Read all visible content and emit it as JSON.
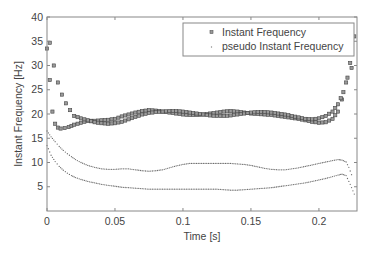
{
  "chart_data": {
    "type": "scatter",
    "title": "",
    "xlabel": "Time [s]",
    "ylabel": "Instant Frequency [Hz]",
    "xlim": [
      0,
      0.228
    ],
    "ylim": [
      0,
      40
    ],
    "xticks": [
      0,
      0.05,
      0.1,
      0.15,
      0.2
    ],
    "xtick_labels": [
      "0",
      "0.05",
      "0.1",
      "0.15",
      "0.2"
    ],
    "yticks": [
      5,
      10,
      15,
      20,
      25,
      30,
      35,
      40
    ],
    "ytick_labels": [
      "5",
      "10",
      "15",
      "20",
      "25",
      "30",
      "35",
      "40"
    ],
    "grid": false,
    "legend_position": "upper right",
    "series": [
      {
        "name": "Instant Frequency",
        "marker": "square",
        "color": "#555555",
        "branches": [
          {
            "x": [
              0.0,
              0.002,
              0.004,
              0.006,
              0.008,
              0.01,
              0.013,
              0.016,
              0.02,
              0.025,
              0.03,
              0.035,
              0.04,
              0.045,
              0.05,
              0.055,
              0.06,
              0.065,
              0.07,
              0.075,
              0.08,
              0.085,
              0.09,
              0.095,
              0.1,
              0.105,
              0.11,
              0.115,
              0.12,
              0.125,
              0.13,
              0.135,
              0.14,
              0.145,
              0.15,
              0.155,
              0.16,
              0.165,
              0.17,
              0.175,
              0.18,
              0.185,
              0.19,
              0.195,
              0.2,
              0.205,
              0.21,
              0.214,
              0.217,
              0.22,
              0.223,
              0.226
            ],
            "y": [
              33.5,
              27.0,
              20.5,
              18.0,
              17.2,
              17.0,
              17.1,
              17.3,
              17.8,
              18.2,
              18.6,
              18.6,
              18.7,
              18.8,
              19.0,
              19.5,
              19.9,
              20.3,
              20.6,
              20.8,
              20.7,
              20.5,
              20.3,
              20.1,
              19.9,
              19.8,
              19.8,
              19.9,
              20.1,
              20.3,
              20.5,
              20.6,
              20.5,
              20.3,
              20.1,
              20.0,
              19.9,
              19.8,
              19.6,
              19.4,
              19.2,
              19.0,
              18.7,
              18.4,
              18.2,
              18.3,
              19.0,
              20.5,
              23.0,
              26.5,
              30.5,
              36.0
            ]
          },
          {
            "x": [
              0.002,
              0.005,
              0.008,
              0.011,
              0.014,
              0.017,
              0.02,
              0.025,
              0.03,
              0.035,
              0.04,
              0.045,
              0.05,
              0.055,
              0.06,
              0.065,
              0.07,
              0.075,
              0.08,
              0.085,
              0.09,
              0.095,
              0.1,
              0.105,
              0.11,
              0.115,
              0.12,
              0.125,
              0.13,
              0.135,
              0.14,
              0.145,
              0.15,
              0.155,
              0.16,
              0.165,
              0.17,
              0.175,
              0.18,
              0.185,
              0.19,
              0.195,
              0.2,
              0.205,
              0.21,
              0.214,
              0.218,
              0.221,
              0.224
            ],
            "y": [
              34.7,
              30.0,
              26.5,
              24.0,
              22.2,
              20.8,
              19.6,
              19.1,
              18.7,
              18.3,
              18.1,
              18.0,
              18.1,
              18.4,
              18.9,
              19.4,
              19.9,
              20.2,
              20.4,
              20.5,
              20.6,
              20.6,
              20.5,
              20.3,
              20.1,
              19.9,
              19.7,
              19.6,
              19.6,
              19.7,
              19.9,
              20.1,
              20.3,
              20.4,
              20.4,
              20.3,
              20.1,
              19.9,
              19.6,
              19.3,
              19.0,
              18.9,
              19.1,
              19.6,
              20.5,
              22.0,
              24.5,
              27.5,
              29.5
            ]
          }
        ]
      },
      {
        "name": "pseudo Instant Frequency",
        "marker": "dot",
        "color": "#777777",
        "branches": [
          {
            "x": [
              0.0,
              0.003,
              0.006,
              0.009,
              0.012,
              0.015,
              0.018,
              0.021,
              0.025,
              0.03,
              0.035,
              0.04,
              0.045,
              0.05,
              0.055,
              0.06,
              0.065,
              0.07,
              0.075,
              0.08,
              0.085,
              0.09,
              0.095,
              0.1,
              0.105,
              0.11,
              0.115,
              0.12,
              0.125,
              0.13,
              0.135,
              0.14,
              0.145,
              0.15,
              0.155,
              0.16,
              0.165,
              0.17,
              0.175,
              0.18,
              0.185,
              0.19,
              0.195,
              0.2,
              0.205,
              0.21,
              0.214,
              0.217,
              0.22,
              0.222,
              0.224
            ],
            "y": [
              16.5,
              15.3,
              14.3,
              13.3,
              12.5,
              11.8,
              11.2,
              10.6,
              10.0,
              9.4,
              9.0,
              8.7,
              8.6,
              8.6,
              8.7,
              8.7,
              8.5,
              8.3,
              8.2,
              8.3,
              8.5,
              8.9,
              9.3,
              9.6,
              9.8,
              9.8,
              9.8,
              9.8,
              9.8,
              9.8,
              9.8,
              9.7,
              9.6,
              9.4,
              9.1,
              8.8,
              8.6,
              8.5,
              8.5,
              8.7,
              8.9,
              9.2,
              9.5,
              9.8,
              10.1,
              10.4,
              10.6,
              10.5,
              10.1,
              9.0,
              7.5
            ]
          },
          {
            "x": [
              0.0,
              0.003,
              0.006,
              0.009,
              0.012,
              0.015,
              0.018,
              0.021,
              0.025,
              0.03,
              0.035,
              0.04,
              0.045,
              0.05,
              0.055,
              0.06,
              0.065,
              0.07,
              0.075,
              0.08,
              0.085,
              0.09,
              0.095,
              0.1,
              0.105,
              0.11,
              0.115,
              0.12,
              0.125,
              0.13,
              0.135,
              0.14,
              0.145,
              0.15,
              0.155,
              0.16,
              0.165,
              0.17,
              0.175,
              0.18,
              0.185,
              0.19,
              0.195,
              0.2,
              0.205,
              0.21,
              0.214,
              0.217,
              0.22,
              0.223,
              0.226
            ],
            "y": [
              13.5,
              11.5,
              10.2,
              9.2,
              8.4,
              7.8,
              7.3,
              6.9,
              6.5,
              6.1,
              5.8,
              5.5,
              5.3,
              5.1,
              4.9,
              4.8,
              4.7,
              4.6,
              4.5,
              4.5,
              4.5,
              4.5,
              4.5,
              4.5,
              4.5,
              4.5,
              4.5,
              4.5,
              4.5,
              4.4,
              4.3,
              4.3,
              4.4,
              4.5,
              4.6,
              4.7,
              4.8,
              5.0,
              5.2,
              5.4,
              5.6,
              5.8,
              6.1,
              6.4,
              6.7,
              7.1,
              7.4,
              7.6,
              7.3,
              5.5,
              3.5
            ]
          }
        ]
      }
    ]
  },
  "legend": {
    "items": [
      {
        "label": "Instant Frequency",
        "marker": "square"
      },
      {
        "label": "pseudo Instant Frequency",
        "marker": "dot"
      }
    ]
  },
  "axes": {
    "xlabel": "Time [s]",
    "ylabel": "Instant Frequency [Hz]"
  },
  "colors": {
    "frame": "#888888",
    "text": "#444444",
    "square_fill": "#999999",
    "square_stroke": "#444444",
    "dot": "#777777"
  }
}
